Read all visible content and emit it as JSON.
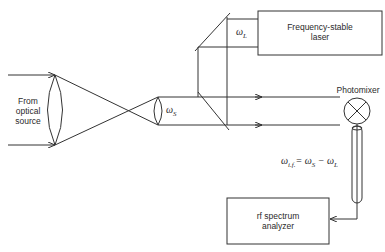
{
  "diagram": {
    "source_label": "From optical source",
    "source_lines": [
      "From",
      "optical",
      "source"
    ],
    "signal_symbol": "ω",
    "signal_sub": "S",
    "laser_symbol": "ω",
    "laser_sub": "L",
    "laser_box": [
      "Frequency-stable",
      "laser"
    ],
    "photomixer_label": "Photomixer",
    "if_equation": {
      "lhs": "ω",
      "lhs_sub": "i.f.",
      "rhs": "= ω",
      "rhs_sub1": "S",
      "minus": " − ω",
      "rhs_sub2": "L"
    },
    "analyzer_box": [
      "rf spectrum",
      "analyzer"
    ],
    "line_color": "#333333"
  }
}
